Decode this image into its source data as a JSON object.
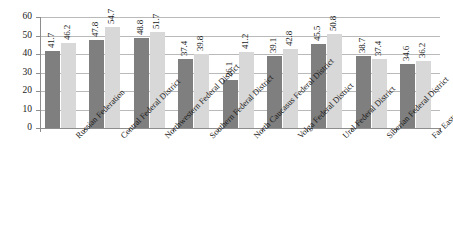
{
  "chart_data": {
    "type": "bar",
    "title": "",
    "subtitle": "",
    "xlabel": "",
    "ylabel": "",
    "ylim": [
      0,
      60
    ],
    "yticks": [
      0,
      10,
      20,
      30,
      40,
      50,
      60
    ],
    "grid": true,
    "legend": "none",
    "orientation": "vertical",
    "grouping": "clustered",
    "categories": [
      "Russian Federation",
      "Central Federal District",
      "Northwestern Federal District",
      "Southern Federal District",
      "North Caucasus Federal District",
      "Volga Federal District",
      "Ural Federal District",
      "Siberian Federal District",
      "Far Eastern Federal District"
    ],
    "series": [
      {
        "name": "series-1",
        "color": "#7f7f7f",
        "values": [
          41.7,
          47.8,
          48.8,
          37.4,
          26.1,
          39.1,
          45.5,
          38.7,
          34.6
        ]
      },
      {
        "name": "series-2",
        "color": "#d8d8d8",
        "values": [
          46.2,
          54.7,
          51.7,
          39.8,
          41.2,
          42.8,
          50.8,
          37.4,
          36.2
        ]
      }
    ],
    "data_labels": [
      [
        "41.7",
        "46.2"
      ],
      [
        "47.8",
        "54.7"
      ],
      [
        "48.8",
        "51.7"
      ],
      [
        "37.4",
        "39.8"
      ],
      [
        "26.1",
        "41.2"
      ],
      [
        "39.1",
        "42.8"
      ],
      [
        "45.5",
        "50.8"
      ],
      [
        "38.7",
        "37.4"
      ],
      [
        "34.6",
        "36.2"
      ]
    ],
    "ytick_labels": [
      "0",
      "10",
      "20",
      "30",
      "40",
      "50",
      "60"
    ],
    "colors": {
      "series_1": "#7f7f7f",
      "series_2": "#d8d8d8",
      "gridline": "#b9b9b9",
      "axis": "#8d8d8d",
      "text": "#1a1a1a",
      "background": "#ffffff"
    }
  }
}
